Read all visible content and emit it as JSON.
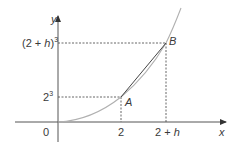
{
  "diagram": {
    "type": "function-graph-secant",
    "curve": "y = x^3",
    "axes": {
      "x_label": "x",
      "y_label": "y",
      "origin_label": "0"
    },
    "x_ticks": [
      {
        "label_base": "2",
        "label_var": ""
      },
      {
        "label_base": "2 + ",
        "label_var": "h"
      }
    ],
    "y_ticks": [
      {
        "label_base": "2",
        "exponent": "3"
      },
      {
        "label_open": "(2 + ",
        "label_var": "h",
        "label_close": ")",
        "exponent": "3"
      }
    ],
    "points": [
      {
        "name": "A",
        "x": "2",
        "y": "2^3"
      },
      {
        "name": "B",
        "x": "2 + h",
        "y": "(2 + h)^3"
      }
    ],
    "colors": {
      "axis": "#555555",
      "curve": "#b0b0b0",
      "chord": "#444444",
      "guide": "#555555",
      "text": "#3a3a3a"
    }
  }
}
